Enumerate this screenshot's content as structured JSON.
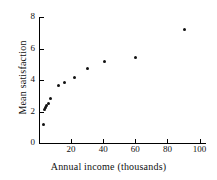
{
  "chart_data": {
    "type": "scatter",
    "title": "",
    "xlabel": "Annual income (thousands)",
    "ylabel": "Mean satisfaction",
    "xlim": [
      0,
      104
    ],
    "ylim": [
      0,
      8
    ],
    "xticks": [
      20,
      40,
      60,
      80,
      100
    ],
    "xtick_labels": [
      "20",
      "40",
      "60",
      "80",
      "100"
    ],
    "yticks": [
      0,
      2,
      4,
      6,
      8
    ],
    "ytick_labels": [
      "0",
      "2",
      "4",
      "6",
      "8"
    ],
    "grid": false,
    "legend": "none",
    "marker": "filled-circle",
    "marker_color": "#111111",
    "points": [
      {
        "x": 3.0,
        "y": 1.2
      },
      {
        "x": 3.6,
        "y": 2.15
      },
      {
        "x": 4.2,
        "y": 2.25
      },
      {
        "x": 4.8,
        "y": 2.35
      },
      {
        "x": 6.0,
        "y": 2.5
      },
      {
        "x": 7.3,
        "y": 2.8
      },
      {
        "x": 12.0,
        "y": 3.65
      },
      {
        "x": 16.0,
        "y": 3.85
      },
      {
        "x": 22.0,
        "y": 4.15
      },
      {
        "x": 30.0,
        "y": 4.75
      },
      {
        "x": 41.0,
        "y": 5.2
      },
      {
        "x": 60.0,
        "y": 5.45
      },
      {
        "x": 90.5,
        "y": 7.2
      }
    ]
  },
  "plot": {
    "geometry": {
      "x_origin_px": 39,
      "y_origin_px": 143,
      "x_scale_px_per_unit": 1.605,
      "y_scale_px_per_unit": 15.75,
      "y_axis_top_px": 17,
      "x_axis_right_px": 206
    }
  }
}
